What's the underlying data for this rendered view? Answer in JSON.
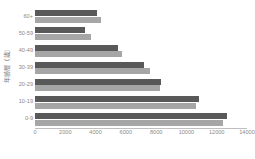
{
  "chart_data": {
    "type": "bar",
    "orientation": "horizontal",
    "title": "",
    "subtitle": "",
    "xlabel": "",
    "ylabel": "年齢層（歳）",
    "categories": [
      "0-9",
      "10-19",
      "20-29",
      "30-39",
      "40-49",
      "50-59",
      "60+"
    ],
    "category_order_top_to_bottom": [
      "60+",
      "50-59",
      "40-49",
      "30-39",
      "20-29",
      "10-19",
      "0-9"
    ],
    "series": [
      {
        "name": "series-1",
        "color": "#595959",
        "values": [
          12700,
          10800,
          8300,
          7200,
          5500,
          3300,
          4100
        ]
      },
      {
        "name": "series-2",
        "color": "#a6a6a6",
        "values": [
          12400,
          10600,
          8250,
          7600,
          5750,
          3700,
          4350
        ]
      }
    ],
    "xlim": [
      0,
      14000
    ],
    "xticks": [
      0,
      2000,
      4000,
      6000,
      8000,
      10000,
      12000,
      14000
    ],
    "xtick_labels": [
      "0",
      "2000",
      "4000",
      "6000",
      "8000",
      "10000",
      "12000",
      "14000"
    ],
    "grid": false,
    "legend": false,
    "legend_position": "none",
    "axis_color": "#bfbfbf",
    "tick_label_color": "#8a8a8a",
    "background": "#ffffff"
  }
}
